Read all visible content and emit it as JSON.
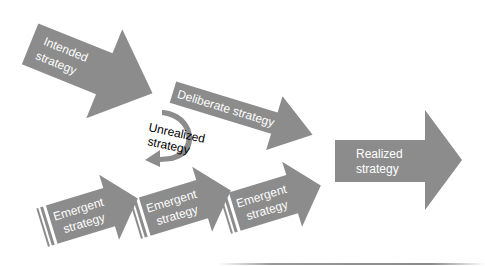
{
  "diagram": {
    "colors": {
      "arrow": "#8c8c8c",
      "label_light": "#ffffff",
      "label_dark": "#000000",
      "background": "#ffffff"
    },
    "nodes": {
      "intended": {
        "line1": "Intended",
        "line2": "strategy"
      },
      "deliberate": {
        "label": "Deliberate strategy"
      },
      "unrealized": {
        "line1": "Unrealized",
        "line2": "strategy"
      },
      "realized": {
        "line1": "Realized",
        "line2": "strategy"
      },
      "emergent": [
        {
          "line1": "Emergent",
          "line2": "strategy"
        },
        {
          "line1": "Emergent",
          "line2": "strategy"
        },
        {
          "line1": "Emergent",
          "line2": "strategy"
        }
      ]
    },
    "edges": [
      {
        "from": "intended",
        "to": "deliberate"
      },
      {
        "from": "intended",
        "to": "unrealized"
      },
      {
        "from": "deliberate",
        "to": "realized"
      },
      {
        "from": "emergent",
        "to": "realized"
      }
    ]
  }
}
